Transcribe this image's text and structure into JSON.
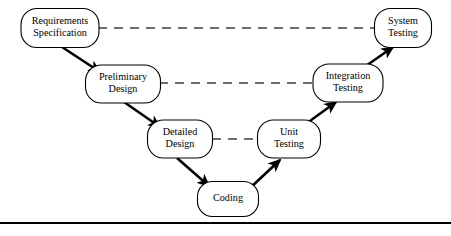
{
  "figure": {
    "background_color": "#ffffff",
    "stroke_color": "#000000",
    "dashed_color": "#3f3f3f",
    "width": 451,
    "height": 236
  },
  "nodes": [
    {
      "id": "requirements-specification",
      "lines": [
        "Requirements",
        "Specification"
      ],
      "line1": "Requirements",
      "line2": "Specification",
      "cx": 60,
      "cy": 28,
      "w": 78,
      "h": 39,
      "rx": 16,
      "font_size": 10.2,
      "side": "left",
      "level": 1
    },
    {
      "id": "preliminary-design",
      "lines": [
        "Preliminary",
        "Design"
      ],
      "line1": "Preliminary",
      "line2": "Design",
      "cx": 123,
      "cy": 84,
      "w": 75,
      "h": 38,
      "rx": 16,
      "font_size": 10.2,
      "side": "left",
      "level": 2
    },
    {
      "id": "detailed-design",
      "lines": [
        "Detailed",
        "Design"
      ],
      "line1": "Detailed",
      "line2": "Design",
      "cx": 180,
      "cy": 139,
      "w": 65,
      "h": 38,
      "rx": 16,
      "font_size": 10.2,
      "side": "left",
      "level": 3
    },
    {
      "id": "coding",
      "lines": [
        "Coding"
      ],
      "line1": "Coding",
      "line2": "",
      "cx": 228,
      "cy": 199,
      "w": 61,
      "h": 35,
      "rx": 15,
      "font_size": 10.2,
      "side": "bottom",
      "level": 4
    },
    {
      "id": "unit-testing",
      "lines": [
        "Unit",
        "Testing"
      ],
      "line1": "Unit",
      "line2": "Testing",
      "cx": 289,
      "cy": 139,
      "w": 63,
      "h": 38,
      "rx": 16,
      "font_size": 10.2,
      "side": "right",
      "level": 3
    },
    {
      "id": "integration-testing",
      "lines": [
        "Integration",
        "Testing"
      ],
      "line1": "Integration",
      "line2": "Testing",
      "cx": 348,
      "cy": 83,
      "w": 70,
      "h": 38,
      "rx": 16,
      "font_size": 10.2,
      "side": "right",
      "level": 2
    },
    {
      "id": "system-testing",
      "lines": [
        "System",
        "Testing"
      ],
      "line1": "System",
      "line2": "Testing",
      "cx": 403,
      "cy": 28,
      "w": 57,
      "h": 39,
      "rx": 16,
      "font_size": 10.2,
      "side": "right",
      "level": 1
    }
  ],
  "flow_edges": [
    {
      "id": "requirements-to-preliminary",
      "from": "requirements-specification",
      "to": "preliminary-design",
      "x1": 62,
      "y1": 47,
      "x2": 100,
      "y2": 72,
      "style": "solid-arrow"
    },
    {
      "id": "preliminary-to-detailed",
      "from": "preliminary-design",
      "to": "detailed-design",
      "x1": 124,
      "y1": 102,
      "x2": 160,
      "y2": 127,
      "style": "solid-arrow"
    },
    {
      "id": "detailed-to-coding",
      "from": "detailed-design",
      "to": "coding",
      "x1": 177,
      "y1": 158,
      "x2": 209,
      "y2": 186,
      "style": "solid-arrow"
    },
    {
      "id": "coding-to-unit-testing",
      "from": "coding",
      "to": "unit-testing",
      "x1": 250,
      "y1": 188,
      "x2": 280,
      "y2": 160,
      "style": "solid-arrow"
    },
    {
      "id": "unit-testing-to-integration-testing",
      "from": "unit-testing",
      "to": "integration-testing",
      "x1": 303,
      "y1": 126,
      "x2": 336,
      "y2": 102,
      "style": "solid-arrow"
    },
    {
      "id": "integration-testing-to-system-testing",
      "from": "integration-testing",
      "to": "system-testing",
      "x1": 363,
      "y1": 68,
      "x2": 393,
      "y2": 47,
      "style": "solid-arrow"
    }
  ],
  "verification_links": [
    {
      "id": "requirements-to-system-testing",
      "from": "requirements-specification",
      "to": "system-testing",
      "x1": 98,
      "y1": 28,
      "x2": 375,
      "y2": 28,
      "style": "dashed"
    },
    {
      "id": "preliminary-to-integration-testing",
      "from": "preliminary-design",
      "to": "integration-testing",
      "x1": 159,
      "y1": 83,
      "x2": 314,
      "y2": 83,
      "style": "dashed"
    },
    {
      "id": "detailed-to-unit-testing",
      "from": "detailed-design",
      "to": "unit-testing",
      "x1": 212,
      "y1": 139,
      "x2": 258,
      "y2": 139,
      "style": "dashed"
    }
  ],
  "footer_rule": {
    "id": "bottom-rule",
    "x1": 0,
    "y1": 223,
    "x2": 451,
    "y2": 223
  }
}
